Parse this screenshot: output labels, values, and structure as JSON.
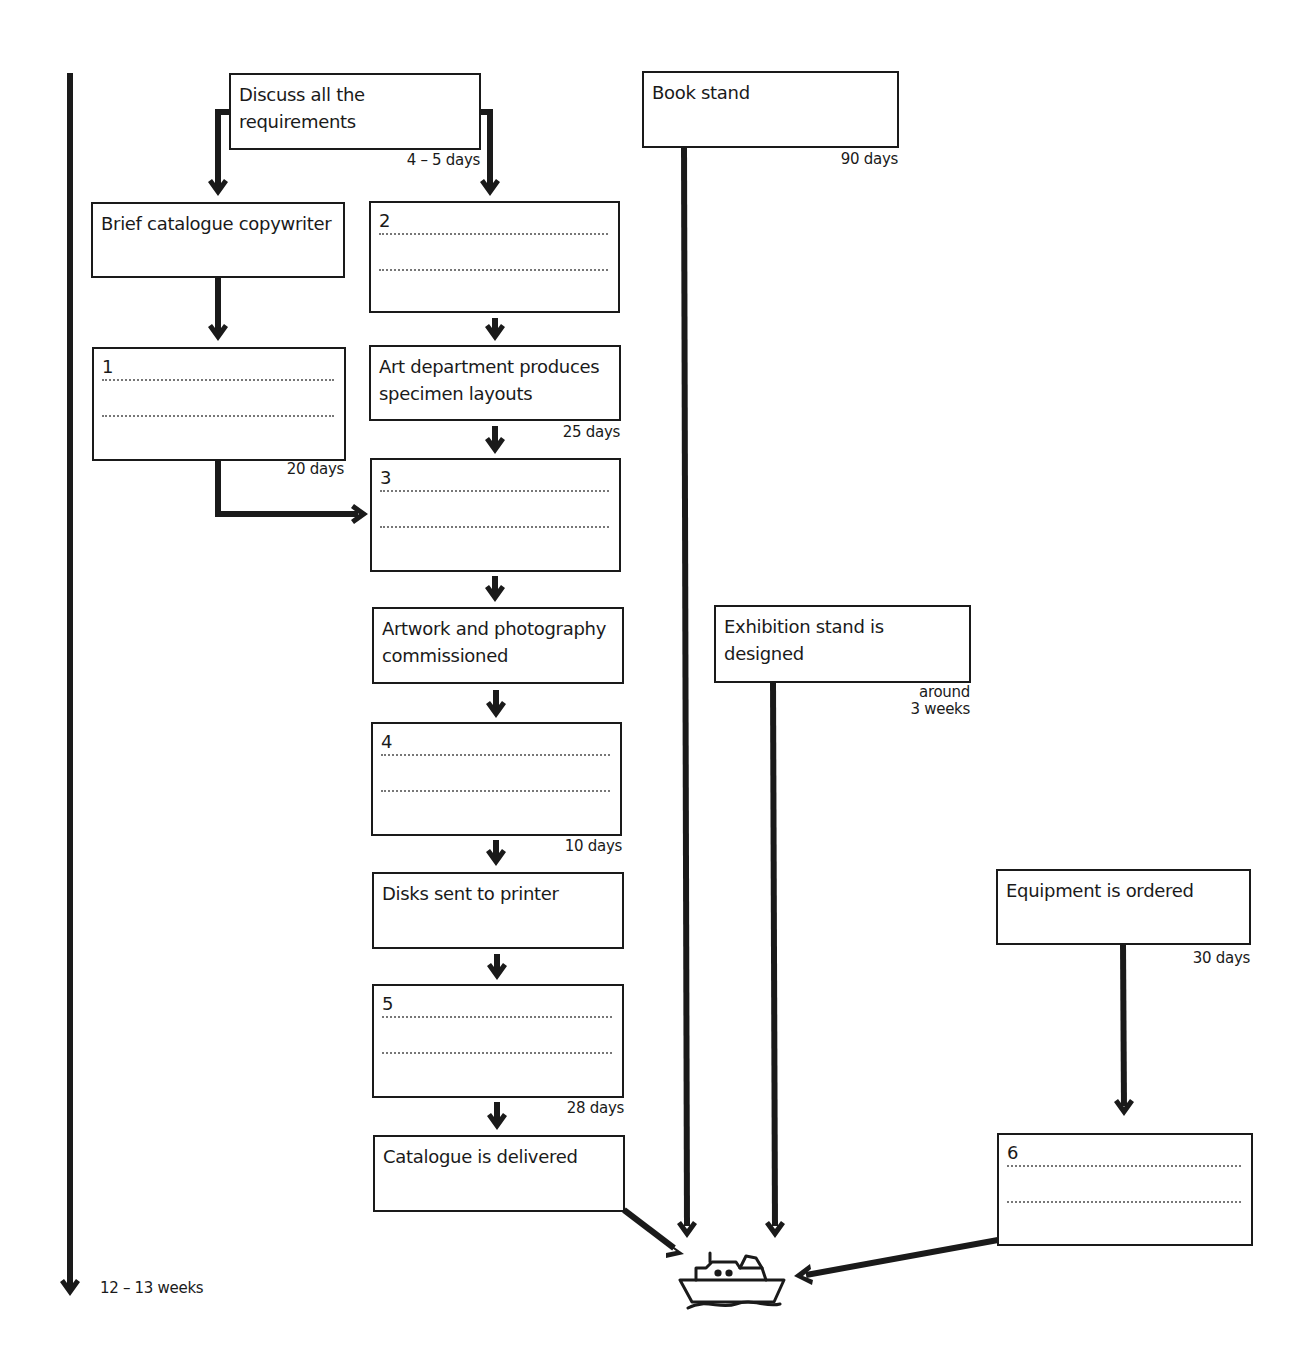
{
  "diagram": {
    "type": "flowchart",
    "timeline": {
      "label": "12 – 13 weeks"
    },
    "boxes": {
      "discuss": {
        "label": "Discuss all the requirements",
        "duration": "4 – 5 days"
      },
      "brief": {
        "label": "Brief catalogue copywriter"
      },
      "blank1": {
        "number": "1",
        "duration": "20 days"
      },
      "blank2": {
        "number": "2"
      },
      "art": {
        "label": "Art department produces specimen layouts",
        "duration": "25 days"
      },
      "blank3": {
        "number": "3"
      },
      "artwork": {
        "label": "Artwork and photography commissioned"
      },
      "blank4": {
        "number": "4",
        "duration": "10 days"
      },
      "disks": {
        "label": "Disks sent to printer"
      },
      "blank5": {
        "number": "5",
        "duration": "28 days"
      },
      "catalogue": {
        "label": "Catalogue is delivered"
      },
      "bookstand": {
        "label": "Book stand",
        "duration": "90 days"
      },
      "exhibition": {
        "label": "Exhibition stand is designed",
        "duration_line1": "around",
        "duration_line2": "3 weeks"
      },
      "equipment": {
        "label": "Equipment is ordered",
        "duration": "30 days"
      },
      "blank6": {
        "number": "6"
      }
    },
    "end_icon": "ship-icon",
    "colors": {
      "line": "#1a1a1a",
      "dots": "#777777",
      "background": "#ffffff"
    }
  }
}
